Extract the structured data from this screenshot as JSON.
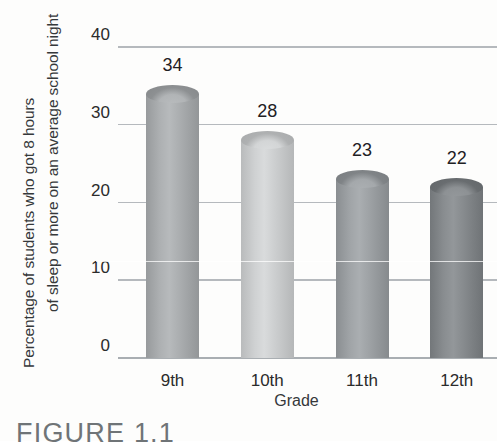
{
  "figure": {
    "caption": "FIGURE 1.1"
  },
  "chart_data": {
    "type": "bar",
    "title": "",
    "subtitle": "",
    "categories": [
      "9th",
      "10th",
      "11th",
      "12th"
    ],
    "values": [
      34,
      28,
      23,
      22
    ],
    "series": [
      {
        "name": "Percentage of students",
        "values": [
          34,
          28,
          23,
          22
        ]
      }
    ],
    "xlabel": "Grade",
    "ylabel_line1": "Percentage of students who got 8 hours",
    "ylabel_line2": "of sleep or more on an average",
    "ylabel_line3": "school night",
    "ylabel": "Percentage of students who got 8 hours of sleep or more on an average school night",
    "ylim": [
      0,
      40
    ],
    "yticks": [
      "0",
      "10",
      "20",
      "30",
      "40"
    ],
    "ytick_values": [
      0,
      10,
      20,
      30,
      40
    ],
    "grid": "horizontal",
    "legend": "none",
    "bar_style": "cylinder",
    "bar_colors": [
      "#a7aaac",
      "#c9cbcc",
      "#9a9ea1",
      "#83878a"
    ],
    "gridline_color": "#a8adb1",
    "label_color": "#2b2b2b",
    "data_labels": [
      "34",
      "28",
      "23",
      "22"
    ],
    "background": "#fdfdfc"
  }
}
